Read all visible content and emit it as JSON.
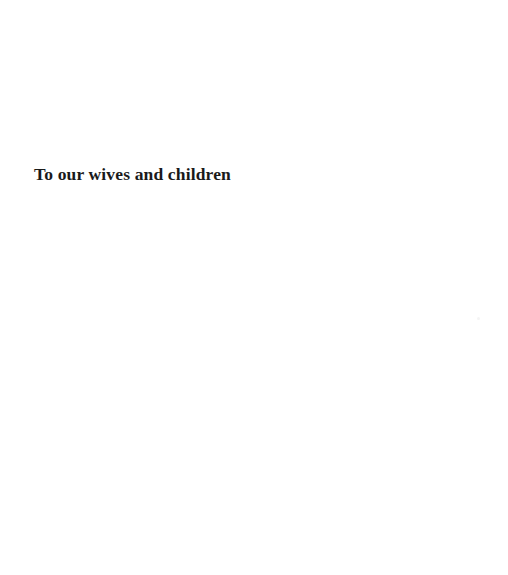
{
  "page": {
    "width": 508,
    "height": 575,
    "background_color": "#ffffff",
    "kind": "dedication-page"
  },
  "dedication": {
    "text": "To our wives and children",
    "ink_color": "#1a1a1a",
    "alignment": "left",
    "emphasis": "bold"
  },
  "artifacts": {
    "speck": {
      "color": "#f4f4f4",
      "x": 477,
      "y": 317
    }
  }
}
